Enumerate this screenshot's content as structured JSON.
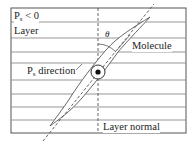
{
  "diagram": {
    "labels": {
      "ps_condition_main": "P",
      "ps_condition_sub": "s",
      "ps_condition_rest": " < 0",
      "layer": "Layer",
      "molecule": "Molecule",
      "ps_direction_main": "P",
      "ps_direction_sub": "s",
      "ps_direction_rest": " direction",
      "layer_normal": "Layer normal",
      "theta": "θ"
    },
    "colors": {
      "line": "#6e6e6e",
      "frame": "#555555",
      "text": "#222222"
    },
    "frame": {
      "x": 11,
      "y": 8,
      "width": 175,
      "height": 125
    },
    "layer_lines_y": [
      22,
      38,
      52,
      63,
      80,
      94,
      107,
      120
    ],
    "layer_normal_x": 98,
    "molecule_axis": {
      "x1": 43,
      "y1": 141,
      "x2": 154,
      "y2": 4
    },
    "molecule_ellipse": {
      "cx": 99,
      "cy": 72,
      "tip_top": [
        150,
        17
      ],
      "tip_bottom": [
        50,
        126
      ]
    },
    "ps_symbol": {
      "cx": 98,
      "cy": 72,
      "r": 7,
      "type": "dot-in-circle"
    }
  }
}
